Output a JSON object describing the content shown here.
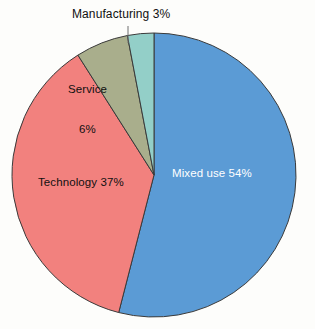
{
  "chart_data": {
    "type": "pie",
    "title": "",
    "subtitle": "",
    "xlabel": "",
    "ylabel": "",
    "grid": false,
    "legend_position": "none",
    "labels_inside_slices": true,
    "categories": [
      "Mixed use",
      "Technology",
      "Service",
      "Manufacturing"
    ],
    "values": [
      54,
      37,
      6,
      3
    ],
    "units": "percent",
    "total": 100,
    "slices": [
      {
        "name": "Mixed use",
        "value": 54,
        "value_text": "54%",
        "label_text": "Mixed use 54%",
        "color": "#5B9BD5",
        "label_color": "#FFFFFF",
        "label_placement": "inside",
        "start_angle_deg": 0,
        "end_angle_deg": 194.4
      },
      {
        "name": "Technology",
        "value": 37,
        "value_text": "37%",
        "label_text": "Technology 37%",
        "color": "#F2817E",
        "label_color": "#101010",
        "label_placement": "inside",
        "start_angle_deg": 194.4,
        "end_angle_deg": 327.6
      },
      {
        "name": "Service",
        "value": 6,
        "value_text": "6%",
        "label_line_1": "Service",
        "label_line_2": "6%",
        "label_text": "Service 6%",
        "color": "#A9AE8C",
        "label_color": "#101010",
        "label_placement": "inside",
        "start_angle_deg": 327.6,
        "end_angle_deg": 349.2
      },
      {
        "name": "Manufacturing",
        "value": 3,
        "value_text": "3%",
        "label_text": "Manufacturing 3%",
        "color": "#93CFC8",
        "label_color": "#101010",
        "label_placement": "outside-with-leader",
        "start_angle_deg": 349.2,
        "end_angle_deg": 360
      }
    ],
    "colors": [
      "#5B9BD5",
      "#F2817E",
      "#A9AE8C",
      "#93CFC8"
    ],
    "background_color": "#FDFDFB",
    "outline_color": "#3A3A3A"
  },
  "geometry": {
    "center_x": 154,
    "center_y": 175,
    "radius": 142,
    "leader_x": 128,
    "leader_y_top": 26,
    "leader_y_bottom": 43
  }
}
